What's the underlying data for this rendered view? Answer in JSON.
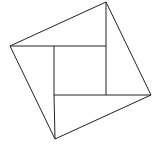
{
  "diagram": {
    "title": "",
    "stroke_color": "#222222",
    "background": "#ffffff",
    "outer_square": [
      [
        106,
        2
      ],
      [
        151,
        95
      ],
      [
        55,
        139
      ],
      [
        10,
        46
      ]
    ],
    "inner_square": [
      [
        54,
        46
      ],
      [
        106,
        46
      ],
      [
        106,
        95
      ],
      [
        54,
        95
      ]
    ],
    "segments": [
      [
        [
          10,
          46
        ],
        [
          54,
          46
        ]
      ],
      [
        [
          106,
          2
        ],
        [
          106,
          46
        ]
      ],
      [
        [
          151,
          95
        ],
        [
          106,
          95
        ]
      ],
      [
        [
          55,
          139
        ],
        [
          54,
          95
        ]
      ]
    ]
  }
}
